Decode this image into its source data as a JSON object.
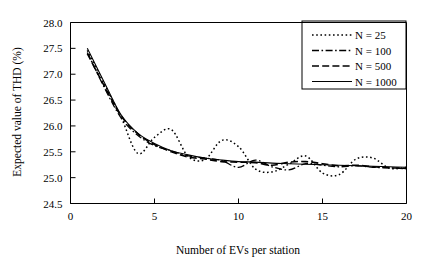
{
  "chart_data": {
    "type": "line",
    "title": "",
    "xlabel": "Number of EVs per station",
    "ylabel": "Expected value of THD (%)",
    "xlim": [
      0,
      20
    ],
    "ylim": [
      24.5,
      28.0
    ],
    "xticks": [
      0,
      5,
      10,
      15,
      20
    ],
    "yticks": [
      24.5,
      25.0,
      25.5,
      26.0,
      26.5,
      27.0,
      27.5,
      28.0
    ],
    "xtick_labels": [
      "0",
      "5",
      "10",
      "15",
      "20"
    ],
    "ytick_labels": [
      "24.5",
      "25.0",
      "25.5",
      "26.0",
      "26.5",
      "27.0",
      "27.5",
      "28.0"
    ],
    "grid": false,
    "legend_position": "top-right",
    "x": [
      1,
      2,
      3,
      4,
      5,
      6,
      7,
      8,
      9,
      10,
      11,
      12,
      13,
      14,
      15,
      16,
      17,
      18,
      19,
      20
    ],
    "series": [
      {
        "name": "N = 25",
        "style": "dotted",
        "dash": "1.6,2.6",
        "width": 1.5,
        "values": [
          27.46,
          26.82,
          26.18,
          25.47,
          25.78,
          25.93,
          25.41,
          25.35,
          25.72,
          25.6,
          25.17,
          25.11,
          25.26,
          25.42,
          25.09,
          25.06,
          25.36,
          25.38,
          25.18,
          25.2
        ]
      },
      {
        "name": "N = 100",
        "style": "dash-dot",
        "dash": "7,2.5,1.6,2.5",
        "width": 1.3,
        "values": [
          27.42,
          26.75,
          26.16,
          25.82,
          25.62,
          25.52,
          25.42,
          25.38,
          25.33,
          25.2,
          25.34,
          25.21,
          25.15,
          25.27,
          25.24,
          25.21,
          25.23,
          25.2,
          25.19,
          25.17
        ]
      },
      {
        "name": "N = 500",
        "style": "dashed",
        "dash": "7,3.2",
        "width": 1.6,
        "values": [
          27.4,
          26.78,
          26.2,
          25.85,
          25.64,
          25.5,
          25.4,
          25.36,
          25.31,
          25.3,
          25.29,
          25.24,
          25.3,
          25.31,
          25.27,
          25.23,
          25.24,
          25.21,
          25.19,
          25.18
        ]
      },
      {
        "name": "N = 1000",
        "style": "solid",
        "dash": "",
        "width": 1.1,
        "values": [
          27.5,
          26.85,
          26.22,
          25.86,
          25.66,
          25.52,
          25.44,
          25.38,
          25.34,
          25.31,
          25.3,
          25.28,
          25.27,
          25.26,
          25.25,
          25.24,
          25.23,
          25.22,
          25.21,
          25.2
        ]
      }
    ]
  },
  "legend": {
    "items": [
      {
        "label": "N = 25"
      },
      {
        "label": "N = 100"
      },
      {
        "label": "N = 500"
      },
      {
        "label": "N = 1000"
      }
    ]
  }
}
